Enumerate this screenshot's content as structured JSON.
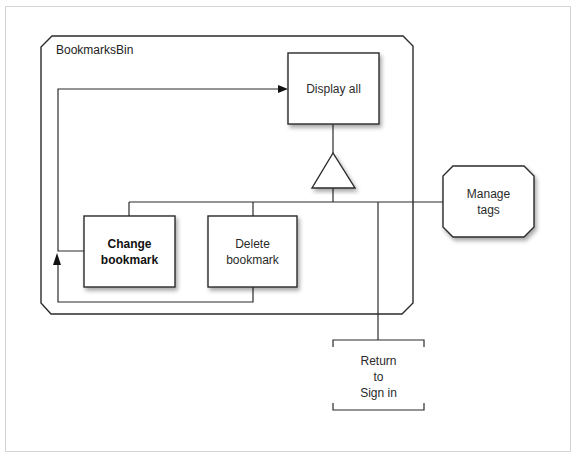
{
  "diagram": {
    "container": {
      "label": "BookmarksBin"
    },
    "nodes": {
      "display_all": {
        "label_lines": [
          "Display all"
        ],
        "shape": "rectangle",
        "bold": false
      },
      "change_bookmark": {
        "label_lines": [
          "Change",
          "bookmark"
        ],
        "shape": "rectangle",
        "bold": true
      },
      "delete_bookmark": {
        "label_lines": [
          "Delete",
          "bookmark"
        ],
        "shape": "rectangle",
        "bold": false
      },
      "manage_tags": {
        "label_lines": [
          "Manage",
          "tags"
        ],
        "shape": "octagon",
        "bold": false
      },
      "return_to_sign_in": {
        "label_lines": [
          "Return",
          "to",
          "Sign in"
        ],
        "shape": "bracket",
        "bold": false
      }
    },
    "connectors": {
      "selection_triangle": {
        "shape": "triangle"
      }
    },
    "edges": [
      {
        "from": "change_bookmark",
        "to": "display_all",
        "arrow": "end"
      },
      {
        "from": "delete_bookmark",
        "to": "change_bookmark",
        "arrow": "up"
      },
      {
        "from": "display_all",
        "to": "selection_triangle",
        "arrow": "none"
      },
      {
        "from": "selection_triangle",
        "to": "change_bookmark",
        "arrow": "none"
      },
      {
        "from": "selection_triangle",
        "to": "delete_bookmark",
        "arrow": "none"
      },
      {
        "from": "selection_triangle",
        "to": "manage_tags",
        "arrow": "none"
      },
      {
        "from": "selection_triangle",
        "to": "return_to_sign_in",
        "arrow": "none"
      }
    ]
  }
}
